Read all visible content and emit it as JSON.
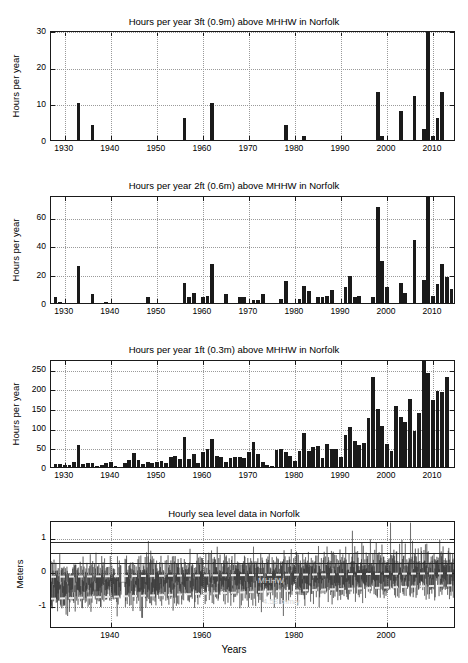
{
  "figure": {
    "width": 468,
    "height": 663,
    "background": "#ffffff",
    "bar_color": "#1a1a1a",
    "axis_color": "#1a1a1a",
    "grid_color": "#9a9a9a",
    "annotation_color": "#d8d8d8",
    "xlabel": "Years"
  },
  "chart_data": [
    {
      "type": "bar",
      "id": "hours-3ft",
      "title": "Hours per year 3ft (0.9m) above MHHW in Norfolk",
      "xlabel": "",
      "ylabel": "Hours per year",
      "xlim": [
        1927,
        2015
      ],
      "ylim": [
        0,
        30
      ],
      "yticks": [
        0,
        10,
        20,
        30
      ],
      "xticks": [
        1930,
        1940,
        1950,
        1960,
        1970,
        1980,
        1990,
        2000,
        2010
      ],
      "grid": true,
      "categories": [
        1928,
        1929,
        1930,
        1931,
        1932,
        1933,
        1934,
        1935,
        1936,
        1937,
        1938,
        1939,
        1940,
        1941,
        1942,
        1943,
        1944,
        1945,
        1946,
        1947,
        1948,
        1949,
        1950,
        1951,
        1952,
        1953,
        1954,
        1955,
        1956,
        1957,
        1958,
        1959,
        1960,
        1961,
        1962,
        1963,
        1964,
        1965,
        1966,
        1967,
        1968,
        1969,
        1970,
        1971,
        1972,
        1973,
        1974,
        1975,
        1976,
        1977,
        1978,
        1979,
        1980,
        1981,
        1982,
        1983,
        1984,
        1985,
        1986,
        1987,
        1988,
        1989,
        1990,
        1991,
        1992,
        1993,
        1994,
        1995,
        1996,
        1997,
        1998,
        1999,
        2000,
        2001,
        2002,
        2003,
        2004,
        2005,
        2006,
        2007,
        2008,
        2009,
        2010,
        2011,
        2012,
        2013,
        2014
      ],
      "values": [
        0,
        0,
        0,
        0,
        0,
        10,
        0,
        0,
        4,
        0,
        0,
        0,
        0,
        0,
        0,
        0,
        0,
        0,
        0,
        0,
        0,
        0,
        0,
        0,
        0,
        0,
        0,
        0,
        6,
        0,
        0,
        0,
        0,
        0,
        10,
        0,
        0,
        0,
        0,
        0,
        0,
        0,
        0,
        0,
        0,
        0,
        0,
        0,
        0,
        0,
        4,
        0,
        0,
        0,
        1,
        0,
        0,
        0,
        0,
        0,
        0,
        0,
        0,
        0,
        0,
        0,
        0,
        0,
        0,
        0,
        13,
        1,
        0,
        0,
        0,
        8,
        0,
        0,
        12,
        0,
        3,
        31,
        1,
        6,
        13,
        0,
        0
      ]
    },
    {
      "type": "bar",
      "id": "hours-2ft",
      "title": "Hours per year 2ft (0.6m) above MHHW in Norfolk",
      "xlabel": "",
      "ylabel": "Hours per year",
      "xlim": [
        1927,
        2015
      ],
      "ylim": [
        0,
        75
      ],
      "yticks": [
        0,
        20,
        40,
        60
      ],
      "xticks": [
        1930,
        1940,
        1950,
        1960,
        1970,
        1980,
        1990,
        2000,
        2010
      ],
      "grid": true,
      "categories": [
        1928,
        1929,
        1930,
        1931,
        1932,
        1933,
        1934,
        1935,
        1936,
        1937,
        1938,
        1939,
        1940,
        1941,
        1942,
        1943,
        1944,
        1945,
        1946,
        1947,
        1948,
        1949,
        1950,
        1951,
        1952,
        1953,
        1954,
        1955,
        1956,
        1957,
        1958,
        1959,
        1960,
        1961,
        1962,
        1963,
        1964,
        1965,
        1966,
        1967,
        1968,
        1969,
        1970,
        1971,
        1972,
        1973,
        1974,
        1975,
        1976,
        1977,
        1978,
        1979,
        1980,
        1981,
        1982,
        1983,
        1984,
        1985,
        1986,
        1987,
        1988,
        1989,
        1990,
        1991,
        1992,
        1993,
        1994,
        1995,
        1996,
        1997,
        1998,
        1999,
        2000,
        2001,
        2002,
        2003,
        2004,
        2005,
        2006,
        2007,
        2008,
        2009,
        2010,
        2011,
        2012,
        2013,
        2014
      ],
      "values": [
        4,
        1,
        0,
        0,
        0,
        26,
        0,
        0,
        6,
        0,
        0,
        1,
        0,
        0,
        0,
        0,
        0,
        0,
        0,
        0,
        4,
        0,
        0,
        0,
        0,
        0,
        0,
        0,
        14,
        4,
        7,
        0,
        4,
        5,
        27,
        0,
        0,
        6,
        0,
        0,
        4,
        4,
        0,
        2,
        2,
        6,
        0,
        0,
        0,
        3,
        15,
        0,
        0,
        3,
        12,
        8,
        0,
        4,
        4,
        5,
        9,
        0,
        0,
        11,
        19,
        4,
        5,
        0,
        0,
        4,
        67,
        29,
        11,
        0,
        0,
        14,
        7,
        0,
        44,
        0,
        16,
        75,
        5,
        13,
        27,
        18,
        10
      ]
    },
    {
      "type": "bar",
      "id": "hours-1ft",
      "title": "Hours per year 1ft (0.3m) above MHHW in Norfolk",
      "xlabel": "",
      "ylabel": "Hours per year",
      "xlim": [
        1927,
        2015
      ],
      "ylim": [
        0,
        275
      ],
      "yticks": [
        0,
        50,
        100,
        150,
        200,
        250
      ],
      "xticks": [
        1930,
        1940,
        1950,
        1960,
        1970,
        1980,
        1990,
        2000,
        2010
      ],
      "grid": true,
      "categories": [
        1928,
        1929,
        1930,
        1931,
        1932,
        1933,
        1934,
        1935,
        1936,
        1937,
        1938,
        1939,
        1940,
        1941,
        1942,
        1943,
        1944,
        1945,
        1946,
        1947,
        1948,
        1949,
        1950,
        1951,
        1952,
        1953,
        1954,
        1955,
        1956,
        1957,
        1958,
        1959,
        1960,
        1961,
        1962,
        1963,
        1964,
        1965,
        1966,
        1967,
        1968,
        1969,
        1970,
        1971,
        1972,
        1973,
        1974,
        1975,
        1976,
        1977,
        1978,
        1979,
        1980,
        1981,
        1982,
        1983,
        1984,
        1985,
        1986,
        1987,
        1988,
        1989,
        1990,
        1991,
        1992,
        1993,
        1994,
        1995,
        1996,
        1997,
        1998,
        1999,
        2000,
        2001,
        2002,
        2003,
        2004,
        2005,
        2006,
        2007,
        2008,
        2009,
        2010,
        2011,
        2012,
        2013,
        2014
      ],
      "values": [
        7,
        8,
        6,
        5,
        12,
        57,
        8,
        11,
        10,
        2,
        4,
        9,
        12,
        3,
        1,
        9,
        17,
        35,
        19,
        8,
        12,
        11,
        12,
        16,
        11,
        25,
        29,
        21,
        77,
        21,
        33,
        11,
        39,
        45,
        71,
        28,
        26,
        14,
        22,
        26,
        25,
        22,
        37,
        64,
        32,
        12,
        5,
        3,
        43,
        46,
        38,
        29,
        16,
        42,
        87,
        41,
        52,
        53,
        23,
        59,
        47,
        45,
        25,
        82,
        101,
        65,
        57,
        61,
        124,
        230,
        147,
        104,
        58,
        40,
        155,
        128,
        114,
        174,
        92,
        138,
        274,
        239,
        170,
        193,
        191,
        228,
        0
      ]
    },
    {
      "type": "line",
      "id": "hourly-sea-level",
      "title": "Hourly sea level data in Norfolk",
      "xlabel": "Years",
      "ylabel": "Meters",
      "xlim": [
        1927,
        2015
      ],
      "ylim": [
        -1.65,
        1.5
      ],
      "yticks": [
        -1,
        0,
        1
      ],
      "xticks": [
        1940,
        1960,
        1980,
        2000
      ],
      "grid": true,
      "series_name": "Hourly sea level",
      "reference_lines": [
        {
          "label": "3ft (0.9m) above MHHW",
          "value": 0.9
        },
        {
          "label": "2ft (0.6m) above MHHW",
          "value": 0.6
        },
        {
          "label": "1ft (0.3m) above MHHW",
          "value": 0.3
        }
      ],
      "trend_lines": [
        {
          "label": "MHHW",
          "start": -0.08,
          "end": 0.02
        },
        {
          "label": "4.58 mm/y",
          "start": -0.72,
          "end": -0.32
        }
      ],
      "annotations": [
        {
          "text": "MHHW",
          "x": 1972,
          "y": -0.25
        },
        {
          "text": "4.58 mm/y",
          "x": 1973,
          "y": -0.85
        }
      ]
    }
  ]
}
